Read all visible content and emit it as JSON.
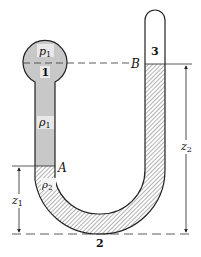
{
  "diagram": {
    "labels": {
      "bulb_pressure": "p",
      "bulb_pressure_sub": "1",
      "point_1": "1",
      "fluid_1_density": "ρ",
      "fluid_1_density_sub": "1",
      "point_A": "A",
      "fluid_2_density": "ρ",
      "fluid_2_density_sub": "2",
      "point_B": "B",
      "point_3": "3",
      "point_2": "2",
      "z1": "z",
      "z1_sub": "1",
      "z2": "z",
      "z2_sub": "2"
    },
    "colors": {
      "fluid_1_fill": "#c8c8c8",
      "hatch_stroke": "#555555",
      "outline": "#222222"
    }
  }
}
